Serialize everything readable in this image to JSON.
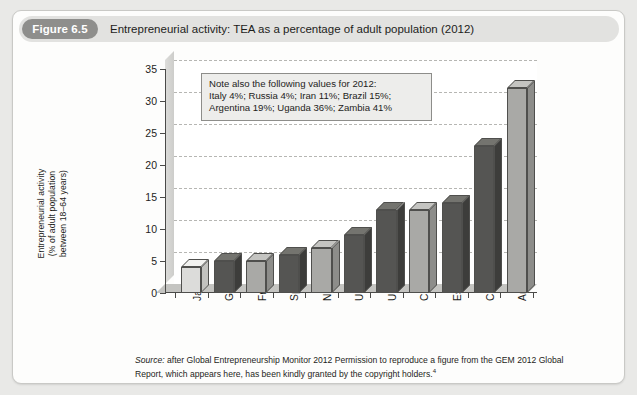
{
  "figure": {
    "number_label": "Figure 6.5",
    "title": "Entrepreneurial activity: TEA as a percentage of adult population (2012)"
  },
  "note_box": {
    "line1": "Note also the following values for 2012:",
    "line2": "Italy 4%; Russia 4%; Iran 11%; Brazil 15%;",
    "line3": "Argentina 19%; Uganda 36%; Zambia 41%"
  },
  "source": {
    "label": "Source:",
    "text": " after Global Entrepreneurship Monitor 2012 Permission to reproduce a figure from the GEM 2012 Global Report, which appears here, has been kindly granted by the copyright holders.",
    "footnote_marker": "4"
  },
  "colors": {
    "card_background": "#fdfdfc",
    "page_background": "#e9e9e7",
    "header_strip": "#e2e2e0",
    "pill": "#8e8e8c",
    "bar_light": "#dcdcda",
    "bar_mid": "#a9a9a6",
    "bar_dark": "#555553",
    "axis": "#4a4a48",
    "gridline": "#b6b6b3"
  },
  "chart_data": {
    "type": "bar",
    "title": "Entrepreneurial activity: TEA as a percentage of adult population (2012)",
    "xlabel": "",
    "ylabel": "Entrepreneurial activity (% of adult population between 18–64 years)",
    "ylabel_lines": [
      "Entrepreneurial activity",
      "(% of adult population",
      "between 18–64 years)"
    ],
    "ylim": [
      0,
      35
    ],
    "yticks": [
      0,
      5,
      10,
      15,
      20,
      25,
      30,
      35
    ],
    "ytick_labels": [
      "0",
      "5",
      "10",
      "15",
      "20",
      "25",
      "30",
      "35"
    ],
    "grid": true,
    "legend": "none",
    "categories": [
      "Japan",
      "Germany",
      "France",
      "Spain",
      "Norway",
      "UK",
      "USA",
      "China",
      "Estonia",
      "Chile",
      "Angola"
    ],
    "values": [
      4,
      5,
      5,
      6,
      7,
      9,
      13,
      13,
      14,
      23,
      32
    ],
    "bar_shades": [
      "light",
      "dark",
      "mid",
      "dark",
      "mid",
      "dark",
      "dark",
      "mid",
      "dark",
      "dark",
      "mid"
    ],
    "annotations": [
      "Note also the following values for 2012:",
      "Italy 4%; Russia 4%; Iran 11%; Brazil 15%;",
      "Argentina 19%; Uganda 36%; Zambia 41%"
    ]
  }
}
